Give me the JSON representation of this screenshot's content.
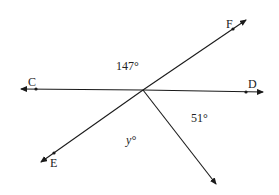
{
  "diagram": {
    "type": "geometry-angles",
    "colors": {
      "line": "#1a1a1a",
      "text": "#222222",
      "background": "#ffffff"
    },
    "points": {
      "C": {
        "label": "C"
      },
      "D": {
        "label": "D"
      },
      "E": {
        "label": "E"
      },
      "F": {
        "label": "F"
      }
    },
    "lines": [
      "line CD",
      "line EF",
      "ray from intersection downward-right"
    ],
    "angles": {
      "top": "147°",
      "right": "51°",
      "bottom": "y°"
    }
  }
}
